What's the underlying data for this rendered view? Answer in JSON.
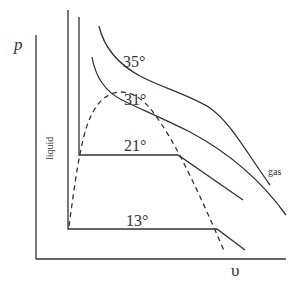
{
  "diagram": {
    "type": "pv-isotherm-diagram",
    "y_axis_label": "p",
    "x_axis_label": "υ",
    "region_labels": {
      "liquid": "liquid",
      "gas": "gas"
    },
    "isotherms": [
      {
        "label": "35°",
        "temperature": 35
      },
      {
        "label": "31°",
        "temperature": 31
      },
      {
        "label": "21°",
        "temperature": 21
      },
      {
        "label": "13°",
        "temperature": 13
      }
    ],
    "coexistence_curve": "dashed",
    "line_color": "#333333",
    "background": "#ffffff"
  }
}
